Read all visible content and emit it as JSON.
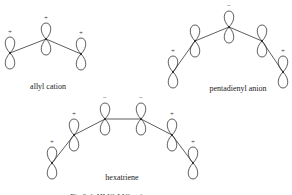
{
  "figure": {
    "caption_partial": "Fig 3.4. HMO MOs of ...",
    "molecules": [
      {
        "name": "allyl cation",
        "label_pos": [
          48,
          89
        ],
        "atoms": [
          {
            "x": 10,
            "y": 53,
            "sign": "+"
          },
          {
            "x": 46,
            "y": 39,
            "sign": "+"
          },
          {
            "x": 81,
            "y": 54,
            "sign": "+"
          }
        ]
      },
      {
        "name": "pentadienyl anion",
        "label_pos": [
          238,
          91
        ],
        "atoms": [
          {
            "x": 173,
            "y": 72,
            "sign": "+"
          },
          {
            "x": 195,
            "y": 41,
            "sign": ""
          },
          {
            "x": 229,
            "y": 27,
            "sign": "−"
          },
          {
            "x": 262,
            "y": 41,
            "sign": ""
          },
          {
            "x": 283,
            "y": 72,
            "sign": "+"
          }
        ]
      },
      {
        "name": "hexatriene",
        "label_pos": [
          122,
          180
        ],
        "atoms": [
          {
            "x": 52,
            "y": 163,
            "sign": "+"
          },
          {
            "x": 74,
            "y": 135,
            "sign": "+"
          },
          {
            "x": 105,
            "y": 119,
            "sign": "−"
          },
          {
            "x": 141,
            "y": 119,
            "sign": "−"
          },
          {
            "x": 172,
            "y": 135,
            "sign": "+"
          },
          {
            "x": 193,
            "y": 163,
            "sign": "+"
          }
        ]
      }
    ]
  }
}
